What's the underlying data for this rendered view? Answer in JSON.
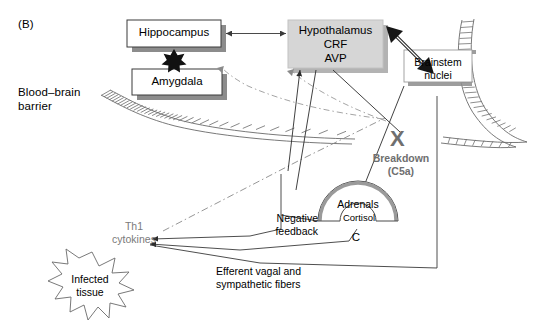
{
  "figure": {
    "panel_label": "(B)",
    "barrier_label": "Blood–brain\nbarrier"
  },
  "nodes": {
    "hippocampus": {
      "label": "Hippocampus"
    },
    "amygdala": {
      "label": "Amygdala"
    },
    "hypothalamus": {
      "label": "Hypothalamus\nCRF\nAVP"
    },
    "brainstem": {
      "label": "Brainstem\nnuclei"
    },
    "adrenals": {
      "label": "Adrenals"
    },
    "cortisol": {
      "label": "Cortisol"
    },
    "cortisol_abbrev": {
      "label": "C"
    },
    "th1": {
      "label": "Th1\ncytokines"
    },
    "infected": {
      "label": "Infected\ntissue"
    }
  },
  "annotations": {
    "breakdown": {
      "marker": "X",
      "label": "Breakdown\n(C5a)"
    },
    "negative_feedback": {
      "label": "Negative\nfeedback"
    },
    "efferent": {
      "label": "Efferent vagal and\nsympathetic fibers"
    }
  },
  "colors": {
    "ink": "#000000",
    "gray_text": "#7a7a7a",
    "box_fill": "#ffffff",
    "hypothalamus_fill": "#d4d4d4",
    "shadow": "#8c8c8c",
    "stroke": "#3a3a3a",
    "background": "#ffffff"
  }
}
